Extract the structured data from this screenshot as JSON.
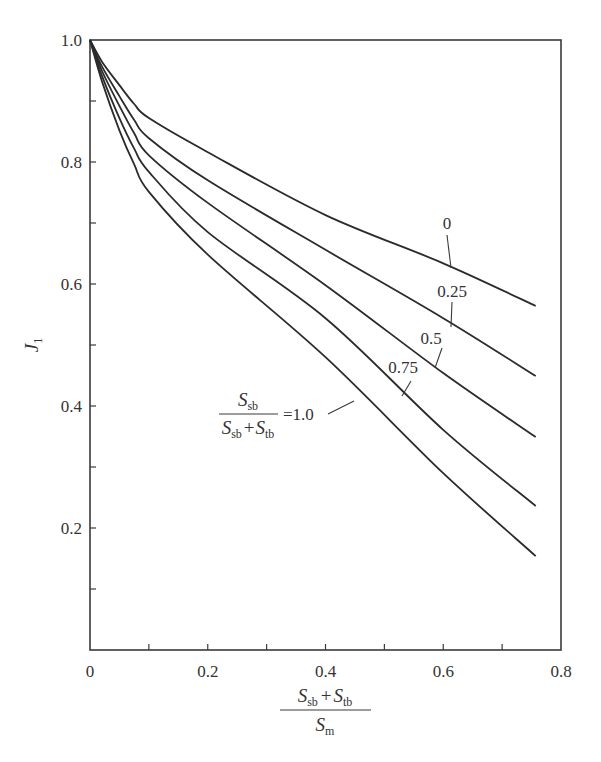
{
  "chart_data": {
    "type": "line",
    "title": "",
    "xlabel": "(S_sb + S_tb) / S_m",
    "ylabel": "J_1",
    "xlim": [
      0,
      0.8
    ],
    "ylim": [
      0,
      1.0
    ],
    "grid": false,
    "x_ticks": [
      0,
      0.2,
      0.4,
      0.6,
      0.8
    ],
    "x_tick_labels": [
      "0",
      "0.2",
      "0.4",
      "0.6",
      "0.8"
    ],
    "x_minor_ticks": [
      0.1,
      0.3,
      0.5,
      0.7
    ],
    "y_ticks": [
      0.2,
      0.4,
      0.6,
      0.8,
      1.0
    ],
    "y_tick_labels": [
      "0.2",
      "0.4",
      "0.6",
      "0.8",
      "1.0"
    ],
    "y_minor_ticks": [
      0.1,
      0.3,
      0.5,
      0.7,
      0.9
    ],
    "x": [
      0,
      0.02,
      0.05,
      0.075,
      0.1,
      0.2,
      0.4,
      0.6,
      0.757
    ],
    "series": [
      {
        "name": "0",
        "label": "0",
        "values": [
          1.0,
          0.965,
          0.926,
          0.895,
          0.872,
          0.816,
          0.713,
          0.634,
          0.564
        ]
      },
      {
        "name": "0.25",
        "label": "0.25",
        "values": [
          1.0,
          0.957,
          0.908,
          0.869,
          0.839,
          0.77,
          0.656,
          0.544,
          0.449
        ]
      },
      {
        "name": "0.5",
        "label": "0.5",
        "values": [
          1.0,
          0.95,
          0.892,
          0.847,
          0.811,
          0.733,
          0.598,
          0.454,
          0.349
        ]
      },
      {
        "name": "0.75",
        "label": "0.75",
        "values": [
          1.0,
          0.942,
          0.872,
          0.822,
          0.784,
          0.685,
          0.544,
          0.361,
          0.236
        ]
      },
      {
        "name": "1.0",
        "label": "1.0",
        "values": [
          1.0,
          0.933,
          0.852,
          0.796,
          0.751,
          0.648,
          0.48,
          0.29,
          0.154
        ]
      }
    ],
    "legend_annotation": {
      "numerator": "S_sb",
      "denominator": "S_sb + S_tb",
      "equals": "=1.0"
    },
    "annotations": [
      {
        "text": "0",
        "series": "0"
      },
      {
        "text": "0.25",
        "series": "0.25"
      },
      {
        "text": "0.5",
        "series": "0.5"
      },
      {
        "text": "0.75",
        "series": "0.75"
      },
      {
        "text": "=1.0",
        "series": "1.0"
      }
    ]
  },
  "axis_labels": {
    "y_symbol": "J",
    "y_sub": "1",
    "x_num_s1": "S",
    "x_num_s1_sub": "sb",
    "x_plus": "+",
    "x_num_s2": "S",
    "x_num_s2_sub": "tb",
    "x_den_s": "S",
    "x_den_sub": "m"
  },
  "formula": {
    "num_s": "S",
    "num_sub": "sb",
    "den_s1": "S",
    "den_s1_sub": "sb",
    "den_plus": "+",
    "den_s2": "S",
    "den_s2_sub": "tb",
    "equals": "=1.0"
  },
  "curve_labels": {
    "c0": "0",
    "c025": "0.25",
    "c05": "0.5",
    "c075": "0.75"
  }
}
